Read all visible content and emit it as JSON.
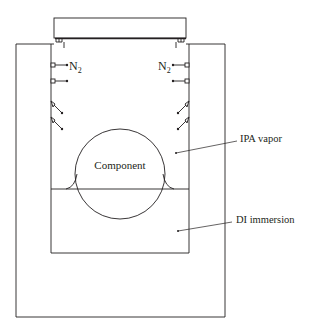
{
  "diagram": {
    "type": "dryer-process-schematic",
    "labels": {
      "n2_left": "N",
      "n2_left_sub": "2",
      "n2_right": "N",
      "n2_right_sub": "2",
      "component": "Component",
      "ipa_vapor": "IPA vapor",
      "di_immersion": "DI immersion"
    },
    "elements": {
      "lid": "lid",
      "outer_tank": "outer-tank",
      "inner_tank": "inner-tank",
      "water_line": "liquid-surface",
      "component_circle": "component",
      "nozzles": [
        "n2-nozzle-left-1",
        "n2-nozzle-left-2",
        "ipa-nozzle-left-1",
        "ipa-nozzle-left-2",
        "n2-nozzle-right-1",
        "n2-nozzle-right-2",
        "ipa-nozzle-right-1",
        "ipa-nozzle-right-2"
      ]
    },
    "colors": {
      "stroke": "#231f20",
      "background": "#ffffff"
    }
  }
}
